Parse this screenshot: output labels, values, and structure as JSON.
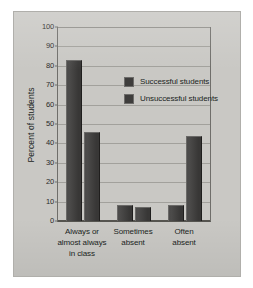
{
  "chart_data": {
    "type": "bar",
    "title": "",
    "xlabel": "",
    "ylabel": "Percent of students",
    "ylim": [
      0,
      100
    ],
    "ytick_step": 10,
    "yticks": [
      "0",
      "10",
      "20",
      "30",
      "40",
      "50",
      "60",
      "70",
      "80",
      "90",
      "100"
    ],
    "grid": true,
    "legend_position": "inside-upper-right",
    "categories": [
      "Always or\nalmost always\nin class",
      "Sometimes\nabsent",
      "Often\nabsent"
    ],
    "category_lines": [
      [
        "Always or",
        "almost always",
        "in class"
      ],
      [
        "Sometimes",
        "absent"
      ],
      [
        "Often",
        "absent"
      ]
    ],
    "series": [
      {
        "name": "Successful students",
        "color": "#3e3d3c",
        "values": [
          83,
          8,
          8
        ]
      },
      {
        "name": "Unsuccessful students",
        "color": "#3e3d3c",
        "values": [
          46,
          7,
          44
        ]
      }
    ]
  },
  "legend": {
    "entries": [
      {
        "label": "Successful students"
      },
      {
        "label": "Unsuccessful students"
      }
    ]
  },
  "figure": {
    "background_color": "#c9c8c4",
    "border_color": "#b0afab",
    "axis_color": "#55544f",
    "gridline_color": "#a2a19c",
    "bar_color": "#3e3d3c"
  }
}
